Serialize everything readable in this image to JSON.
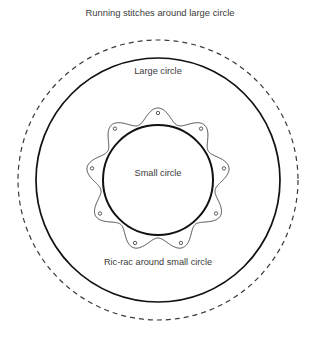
{
  "figure": {
    "title": "Running stitches around large circle",
    "labels": {
      "large_circle": "Large circle",
      "small_circle": "Small circle",
      "ric_rac": "Ric-rac around small circle"
    }
  },
  "colors": {
    "background": "#ffffff",
    "stroke_solid": "#111111",
    "stroke_dashed": "#3a3a3a",
    "stroke_ricrac": "#4a4a4a",
    "text": "#3a3a3a"
  },
  "geometry": {
    "center_x": 158,
    "center_y": 180,
    "running_stitch_radius": 140,
    "large_circle_radius": 122,
    "ric_rac_outer_radius": 72,
    "ric_rac_inner_radius": 58,
    "ric_rac_lobes": 9,
    "small_circle_radius": 55,
    "stitch_dot_radius": 1.7,
    "stitch_dot_count": 9,
    "dash_pattern": "5,4"
  },
  "text_positions": {
    "title_x": 160,
    "title_y": 9,
    "large_circle_label_x": 158,
    "large_circle_label_y": 72,
    "small_circle_label_x": 158,
    "small_circle_label_y": 174,
    "ric_rac_label_x": 158,
    "ric_rac_label_y": 263
  }
}
